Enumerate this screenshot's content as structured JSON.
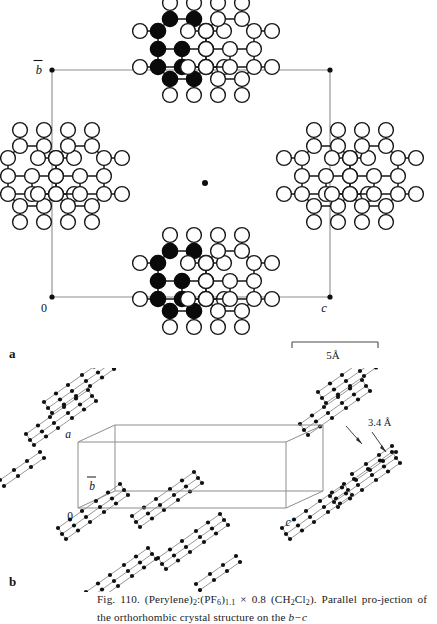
{
  "figure": {
    "panel_labels": {
      "a": "a",
      "b": "b"
    },
    "caption": {
      "number": "Fig. 110.",
      "formula_text": "(Perylene)2:(PF6)1.1 × 0.8 (CH2Cl2).",
      "line1": "Fig. 110. (Perylene)2:(PF6)1.1 × 0.8 (CH2Cl2). Parallel pro-",
      "line2": "jection of the orthorhombic crystal structure on the b−c",
      "parts": {
        "fig_no": "Fig. 110.",
        "perylene": "(Perylene)",
        "perylene_sub": "2",
        "colon": ":",
        "pf6": "(PF",
        "pf6_sub": "6",
        "pf6_close": ")",
        "pf6_stoich": "1.1",
        "times": "× 0.8 ",
        "ch2cl2_open": "(CH",
        "ch2_sub": "2",
        "cl": "Cl",
        "cl_sub": "2",
        "ch2cl2_close": ").",
        "sentence2_a": "Parallel pro-jection of the orthorhombic crystal structure on the ",
        "axis_bc": "b−c"
      }
    }
  },
  "panel_a": {
    "name": "parallel-projection-bc-plane",
    "axis_labels": {
      "b": "b",
      "b_overbar": true,
      "origin": "0",
      "c": "c"
    },
    "scale_bar": {
      "label": "5Å",
      "length_px": 86,
      "represents_angstrom": 5
    },
    "unit_cell": {
      "left_px": 52,
      "right_px": 330,
      "top_px": 70,
      "bottom_px": 297,
      "corner_dots": 4,
      "center_dot": {
        "x": 205,
        "y": 183
      }
    },
    "molecules": [
      {
        "id": "top-stack-filled",
        "x": 170,
        "y": 58,
        "fill": "black"
      },
      {
        "id": "top-stack-open",
        "x": 215,
        "y": 58,
        "fill": "white"
      },
      {
        "id": "bottom-stack-filled",
        "x": 170,
        "y": 290,
        "fill": "black"
      },
      {
        "id": "bottom-stack-open",
        "x": 215,
        "y": 290,
        "fill": "white"
      },
      {
        "id": "left-edge-open-1",
        "x": 20,
        "y": 185,
        "fill": "white"
      },
      {
        "id": "left-edge-open-2",
        "x": 68,
        "y": 185,
        "fill": "white"
      },
      {
        "id": "right-edge-open-1",
        "x": 318,
        "y": 185,
        "fill": "white"
      },
      {
        "id": "right-edge-open-2",
        "x": 366,
        "y": 185,
        "fill": "white"
      }
    ]
  },
  "panel_b": {
    "name": "perspective-crystal-packing",
    "axis_labels": {
      "a": "a",
      "b": "b",
      "b_overbar": true,
      "c": "c",
      "origin": "0"
    },
    "annotation": {
      "label": "3.4 Å",
      "meaning": "interplanar-stacking-distance"
    },
    "stack_count": 10
  },
  "colors": {
    "ink": "#141414",
    "cell_line": "#8d8d8d",
    "atom_stroke": "#161616",
    "atom_fill_open": "#ffffff",
    "atom_fill_closed": "#0a0a0a",
    "paper": "#ffffff"
  }
}
